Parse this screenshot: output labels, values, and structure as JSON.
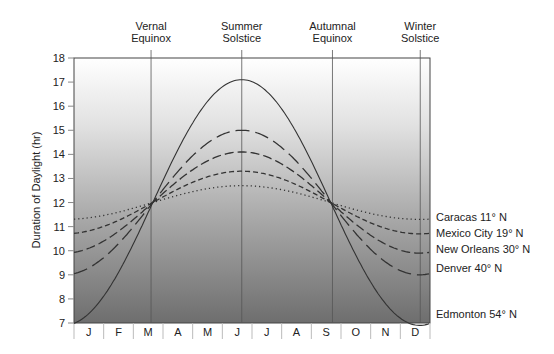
{
  "chart_data": {
    "type": "line",
    "title": "",
    "xlabel": "",
    "ylabel": "Duration of Daylight (hr)",
    "ylim": [
      7,
      18
    ],
    "yticks": [
      7,
      8,
      9,
      10,
      11,
      12,
      13,
      14,
      15,
      16,
      17,
      18
    ],
    "categories": [
      "J",
      "F",
      "M",
      "A",
      "M",
      "J",
      "J",
      "A",
      "S",
      "O",
      "N",
      "D"
    ],
    "annotations": [
      {
        "label": [
          "Vernal",
          "Equinox"
        ],
        "day": 79
      },
      {
        "label": [
          "Summer",
          "Solstice"
        ],
        "day": 172
      },
      {
        "label": [
          "Autumnal",
          "Equinox"
        ],
        "day": 265
      },
      {
        "label": [
          "Winter",
          "Solstice"
        ],
        "day": 355
      }
    ],
    "series": [
      {
        "name": "Caracas 11° N",
        "latitude": 11,
        "max": 12.7,
        "min": 11.3,
        "style": "dotted"
      },
      {
        "name": "Mexico City 19° N",
        "latitude": 19,
        "max": 13.3,
        "min": 10.7,
        "style": "short-dash"
      },
      {
        "name": "New Orleans 30° N",
        "latitude": 30,
        "max": 14.1,
        "min": 9.9,
        "style": "medium-dash"
      },
      {
        "name": "Denver 40° N",
        "latitude": 40,
        "max": 15.0,
        "min": 9.0,
        "style": "long-dash"
      },
      {
        "name": "Edmonton 54° N",
        "latitude": 54,
        "max": 17.1,
        "min": 6.9,
        "style": "solid"
      }
    ],
    "legend_position": "right",
    "grid": false
  }
}
